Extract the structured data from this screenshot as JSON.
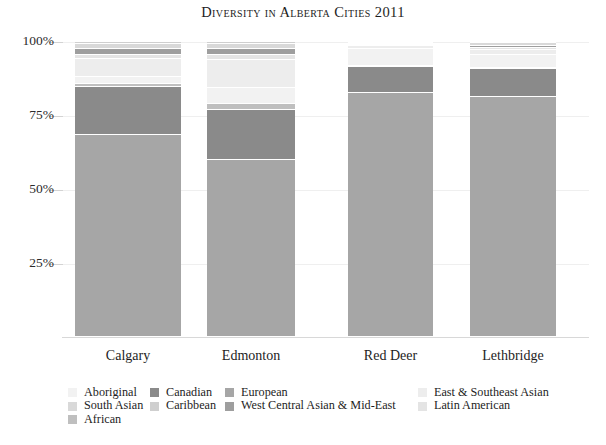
{
  "chart_data": {
    "type": "bar",
    "subtype": "stacked-percentage-column",
    "title": "Diversity in Alberta Cities 2011",
    "xlabel": "",
    "ylabel": "",
    "ylim": [
      0,
      100
    ],
    "yticks": [
      25,
      50,
      75,
      100
    ],
    "ytick_labels": [
      "25%",
      "50%",
      "75%",
      "100%"
    ],
    "grid": true,
    "legend_position": "bottom",
    "categories": [
      "Calgary",
      "Edmonton",
      "Red Deer",
      "Lethbridge"
    ],
    "series": [
      {
        "name": "Aboriginal",
        "color": "#f2f2f2",
        "values": [
          2.4,
          5.3,
          5.7,
          4.4
        ]
      },
      {
        "name": "European",
        "color": "#a6a6a6",
        "values": [
          68.6,
          60.0,
          82.6,
          81.5
        ]
      },
      {
        "name": "Canadian",
        "color": "#8a8a8a",
        "values": [
          16.1,
          17.0,
          9.1,
          9.3
        ]
      },
      {
        "name": "South Asian",
        "color": "#d9d9d9",
        "values": [
          1.6,
          1.6,
          0.5,
          1.0
        ]
      },
      {
        "name": "Caribbean",
        "color": "#cfcfcf",
        "values": [
          0.6,
          0.6,
          0.2,
          0.3
        ]
      },
      {
        "name": "West Central Asian & Mid-East",
        "color": "#9e9e9e",
        "values": [
          2.2,
          2.2,
          0.4,
          0.6
        ]
      },
      {
        "name": "East & Southeast Asian",
        "color": "#ededed",
        "values": [
          6.1,
          9.6,
          0.9,
          1.8
        ]
      },
      {
        "name": "Latin American",
        "color": "#e4e4e4",
        "values": [
          1.3,
          1.6,
          0.4,
          0.7
        ]
      },
      {
        "name": "African",
        "color": "#bfbfbf",
        "values": [
          1.1,
          2.1,
          0.2,
          0.4
        ]
      }
    ],
    "stack_order_bottom_to_top": [
      "European",
      "Canadian",
      "African",
      "Aboriginal",
      "East & Southeast Asian",
      "Latin American",
      "West Central Asian & Mid-East",
      "South Asian",
      "Caribbean"
    ]
  },
  "axis": {
    "y_tick_labels": [
      "100%",
      "75%",
      "50%",
      "25%"
    ],
    "x_tick_labels": [
      "Calgary",
      "Edmonton",
      "Red Deer",
      "Lethbridge"
    ]
  },
  "legend": {
    "columns": [
      {
        "items": [
          {
            "label": "Aboriginal",
            "color": "#f2f2f2"
          },
          {
            "label": "South Asian",
            "color": "#d9d9d9"
          },
          {
            "label": "African",
            "color": "#bfbfbf"
          }
        ]
      },
      {
        "items": [
          {
            "label": "Canadian",
            "color": "#8a8a8a"
          },
          {
            "label": "Caribbean",
            "color": "#cfcfcf"
          }
        ]
      },
      {
        "items": [
          {
            "label": "European",
            "color": "#a6a6a6"
          },
          {
            "label": "West Central Asian & Mid-East",
            "color": "#9e9e9e"
          }
        ]
      },
      {
        "items": [
          {
            "label": "East & Southeast Asian",
            "color": "#ededed"
          },
          {
            "label": "Latin American",
            "color": "#e4e4e4"
          }
        ]
      }
    ]
  },
  "layout": {
    "bars": [
      {
        "name": "Calgary",
        "left": 75,
        "width": 106
      },
      {
        "name": "Edmonton",
        "left": 207,
        "width": 88
      },
      {
        "name": "Red Deer",
        "left": 348,
        "width": 85
      },
      {
        "name": "Lethbridge",
        "left": 470,
        "width": 86
      }
    ],
    "legend_columns_left": [
      68,
      150,
      225,
      418
    ],
    "plot_top_y": 42,
    "plot_bottom_y": 337,
    "tick_y": {
      "100": 42,
      "75": 115.5,
      "50": 189.5,
      "25": 263.5
    }
  },
  "footer": {
    "note": ""
  }
}
